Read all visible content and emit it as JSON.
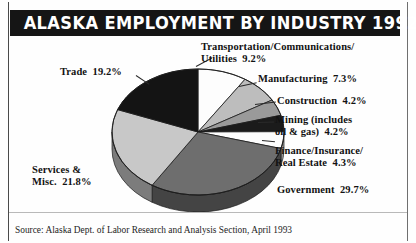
{
  "header": {
    "title": "ALASKA EMPLOYMENT BY INDUSTRY 1992"
  },
  "footer": {
    "source": "Source: Alaska Dept. of Labor Research and Analysis Section, April 1993"
  },
  "labels": {
    "transportation": "Transportation/Communications/\nUtilities  9.2%",
    "manufacturing": "Manufacturing  7.3%",
    "construction": "Construction  4.2%",
    "mining": "Mining (includes\noil & gas)  4.2%",
    "finance": "Finance/Insurance/\nReal Estate  4.3%",
    "government": "Government  29.7%",
    "trade": "Trade  19.2%",
    "services": "Services &\nMisc.  21.8%"
  },
  "chart_data": {
    "type": "pie",
    "title": "ALASKA EMPLOYMENT BY INDUSTRY 1992",
    "subtitle": "",
    "xlabel": "",
    "ylabel": "",
    "units": "percent of total employment",
    "three_d": true,
    "legend": "labels placed around pie with leader lines",
    "source": "Alaska Dept. of Labor Research and Analysis Section, April 1993",
    "categories": [
      "Transportation/Communications/Utilities",
      "Manufacturing",
      "Construction",
      "Mining (includes oil & gas)",
      "Finance/Insurance/Real Estate",
      "Government",
      "Services & Misc.",
      "Trade"
    ],
    "values": [
      9.2,
      7.3,
      4.2,
      4.2,
      4.3,
      29.7,
      21.8,
      19.2
    ],
    "slice_colors": [
      "#fdfdfd",
      "#bdbdbd",
      "#9a9a9a",
      "#1b1b1b",
      "#fdfdfd",
      "#6e6e6e",
      "#c8c8c8",
      "#141414"
    ],
    "total": 99.9
  }
}
